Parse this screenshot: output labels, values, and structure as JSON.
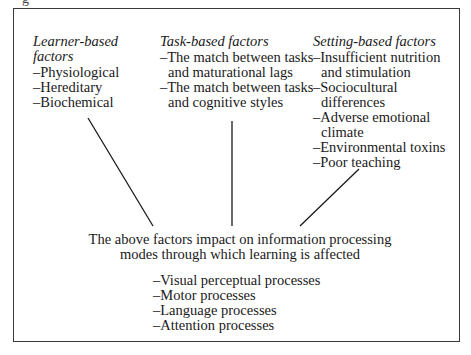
{
  "figure_label": "g",
  "columns": {
    "learner": {
      "heading": "Learner-based factors",
      "items": [
        "–Physiological",
        "–Hereditary",
        "–Biochemical"
      ]
    },
    "task": {
      "heading": "Task-based factors",
      "items": [
        "–The match between tasks and maturational lags",
        "–The match between tasks and cognitive styles"
      ]
    },
    "setting": {
      "heading": "Setting-based factors",
      "items": [
        "–Insufficient nutrition and stimulation",
        "–Sociocultural differences",
        "–Adverse emotional climate",
        "–Environmental toxins",
        "–Poor teaching"
      ]
    }
  },
  "center": {
    "line1": "The above factors impact on information processing",
    "line2": "modes through which learning is affected"
  },
  "modes": [
    "–Visual perceptual processes",
    "–Motor processes",
    "–Language processes",
    "–Attention processes"
  ],
  "colors": {
    "line": "#1a1a1a",
    "border": "#3a3a3a"
  }
}
